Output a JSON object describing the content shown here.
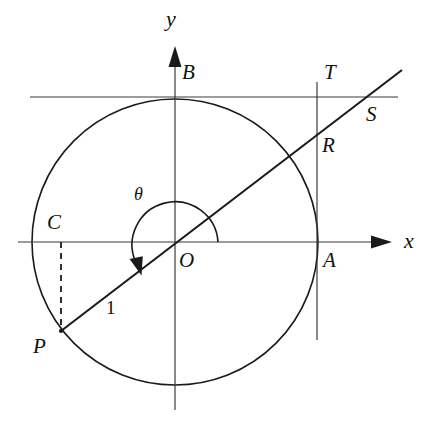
{
  "figure": {
    "type": "geometry-diagram",
    "background_color": "#ffffff",
    "stroke_color": "#1a1a1a"
  },
  "axes": {
    "x_label": "x",
    "y_label": "y",
    "origin_label": "O",
    "x_axis": {
      "x1": 18,
      "y1": 242,
      "x2": 392,
      "y2": 242,
      "arrow": "right"
    },
    "y_axis": {
      "x1": 175,
      "y1": 410,
      "x2": 175,
      "y2": 46,
      "arrow": "up"
    }
  },
  "circle": {
    "center_x": 175,
    "center_y": 242,
    "radius": 143,
    "label": "unit-circle"
  },
  "angle": {
    "symbol": "θ",
    "arc_radius": 43,
    "direction": "counterclockwise",
    "start_deg": 0,
    "end_deg": 218
  },
  "radius_segment": {
    "label": "1",
    "from": "O",
    "to": "P"
  },
  "points": [
    {
      "name": "A",
      "label": "A",
      "x": 317,
      "y": 242,
      "label_x": 322,
      "label_y": 250
    },
    {
      "name": "B",
      "label": "B",
      "x": 175,
      "y": 97,
      "label_x": 182,
      "label_y": 64
    },
    {
      "name": "C",
      "label": "C",
      "x": 61,
      "y": 242,
      "label_x": 49,
      "label_y": 209
    },
    {
      "name": "O",
      "label": "O",
      "x": 175,
      "y": 242,
      "label_x": 180,
      "label_y": 250
    },
    {
      "name": "P",
      "label": "P",
      "x": 61,
      "y": 331,
      "label_x": 34,
      "label_y": 336
    },
    {
      "name": "R",
      "label": "R",
      "x": 317,
      "y": 131,
      "label_x": 322,
      "label_y": 134
    },
    {
      "name": "S",
      "label": "S",
      "x": 374,
      "y": 97,
      "label_x": 366,
      "label_y": 100
    },
    {
      "name": "T",
      "label": "T",
      "x": 317,
      "y": 97,
      "label_x": 323,
      "label_y": 64
    }
  ],
  "lines": {
    "tangent_horizontal": {
      "x1": 30,
      "y1": 97,
      "x2": 398,
      "y2": 97,
      "description": "horizontal tangent at B"
    },
    "tangent_vertical": {
      "x1": 317,
      "y1": 82,
      "x2": 317,
      "y2": 340,
      "description": "vertical tangent at A"
    },
    "secant_ray": {
      "x1": 61,
      "y1": 331,
      "x2": 402,
      "y2": 70,
      "description": "line through P, O, R, S"
    },
    "dashed_drop": {
      "x1": 61,
      "y1": 242,
      "x2": 61,
      "y2": 331,
      "description": "dashed segment from C to P"
    }
  }
}
